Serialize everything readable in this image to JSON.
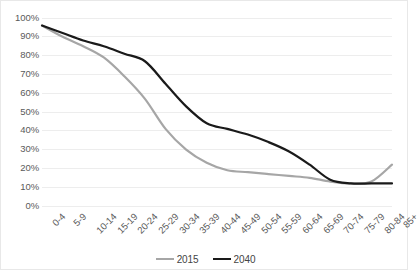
{
  "chart_data": {
    "type": "line",
    "title": "",
    "subtitle": "",
    "xlabel": "",
    "ylabel": "",
    "ylim": [
      0,
      100
    ],
    "ytick_values": [
      0,
      10,
      20,
      30,
      40,
      50,
      60,
      70,
      80,
      90,
      100
    ],
    "ytick_labels": [
      "0%",
      "10%",
      "20%",
      "30%",
      "40%",
      "50%",
      "60%",
      "70%",
      "80%",
      "90%",
      "100%"
    ],
    "categories": [
      "0-4",
      "5-9",
      "10-14",
      "15-19",
      "20-24",
      "25-29",
      "30-34",
      "35-39",
      "40-44",
      "45-49",
      "50-54",
      "55-59",
      "60-64",
      "65-69",
      "70-74",
      "75-79",
      "80-84",
      "85+"
    ],
    "grid": true,
    "grid_axis": "y",
    "legend_position": "bottom",
    "series": [
      {
        "name": "2015",
        "color": "#a6a6a6",
        "values": [
          96,
          90,
          85,
          79,
          69,
          57,
          41,
          30,
          23,
          19,
          18,
          17,
          16,
          15,
          13,
          12,
          13,
          22
        ]
      },
      {
        "name": "2040",
        "color": "#1a1a1a",
        "values": [
          96,
          92,
          88,
          85,
          81,
          77,
          65,
          53,
          44,
          41,
          38,
          34,
          29,
          22,
          14,
          12,
          12,
          12
        ]
      }
    ]
  },
  "legend": {
    "items": [
      {
        "label": "2015",
        "color": "#a6a6a6"
      },
      {
        "label": "2040",
        "color": "#1a1a1a"
      }
    ]
  },
  "axes": {
    "gridline_color": "#ededed",
    "axis_text_color": "#5a5a5a",
    "border_color": "#e8e8e8"
  }
}
